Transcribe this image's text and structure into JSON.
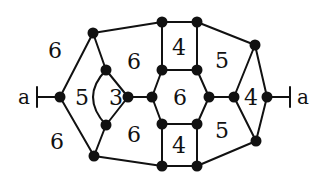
{
  "diagram": {
    "type": "planar-graph",
    "end_labels": {
      "left": "a",
      "right": "a"
    },
    "vertices": [
      {
        "id": "L",
        "x": 60,
        "y": 97
      },
      {
        "id": "TL",
        "x": 93,
        "y": 33
      },
      {
        "id": "BL",
        "x": 94,
        "y": 156
      },
      {
        "id": "T3",
        "x": 106,
        "y": 70
      },
      {
        "id": "B3",
        "x": 106,
        "y": 125
      },
      {
        "id": "R3",
        "x": 128,
        "y": 97
      },
      {
        "id": "H1",
        "x": 152,
        "y": 97
      },
      {
        "id": "H2",
        "x": 162,
        "y": 70
      },
      {
        "id": "H3",
        "x": 197,
        "y": 70
      },
      {
        "id": "H4",
        "x": 209,
        "y": 97
      },
      {
        "id": "H5",
        "x": 197,
        "y": 124
      },
      {
        "id": "H6",
        "x": 162,
        "y": 124
      },
      {
        "id": "S1",
        "x": 162,
        "y": 22
      },
      {
        "id": "S2",
        "x": 197,
        "y": 22
      },
      {
        "id": "S3",
        "x": 162,
        "y": 166
      },
      {
        "id": "S4",
        "x": 197,
        "y": 166
      },
      {
        "id": "RT",
        "x": 255,
        "y": 45
      },
      {
        "id": "RB",
        "x": 256,
        "y": 141
      },
      {
        "id": "RI",
        "x": 234,
        "y": 97
      },
      {
        "id": "R",
        "x": 267,
        "y": 97
      }
    ],
    "edges": [
      [
        "L",
        "TL"
      ],
      [
        "L",
        "BL"
      ],
      [
        "TL",
        "T3"
      ],
      [
        "BL",
        "B3"
      ],
      [
        "T3",
        "R3"
      ],
      [
        "B3",
        "R3"
      ],
      [
        "R3",
        "H1"
      ],
      [
        "H1",
        "H2"
      ],
      [
        "H2",
        "H3"
      ],
      [
        "H3",
        "H4"
      ],
      [
        "H4",
        "H5"
      ],
      [
        "H5",
        "H6"
      ],
      [
        "H6",
        "H1"
      ],
      [
        "TL",
        "S1"
      ],
      [
        "S1",
        "S2"
      ],
      [
        "S1",
        "H2"
      ],
      [
        "S2",
        "H3"
      ],
      [
        "BL",
        "S3"
      ],
      [
        "S3",
        "S4"
      ],
      [
        "S3",
        "H6"
      ],
      [
        "S4",
        "H5"
      ],
      [
        "S2",
        "RT"
      ],
      [
        "S4",
        "RB"
      ],
      [
        "H4",
        "RI"
      ],
      [
        "RI",
        "RT"
      ],
      [
        "RI",
        "RB"
      ],
      [
        "RT",
        "R"
      ],
      [
        "RB",
        "R"
      ]
    ],
    "curved_edges": [
      {
        "from": "T3",
        "to": "B3",
        "control": {
          "x": 80,
          "y": 97
        }
      }
    ],
    "end_ticks": [
      {
        "side": "left",
        "from": "L",
        "tick_x": 37
      },
      {
        "side": "right",
        "from": "R",
        "tick_x": 290
      }
    ],
    "faces": [
      {
        "label": "6",
        "x": 55,
        "y": 50
      },
      {
        "label": "6",
        "x": 57,
        "y": 141
      },
      {
        "label": "5",
        "x": 82,
        "y": 97
      },
      {
        "label": "3",
        "x": 116,
        "y": 97
      },
      {
        "label": "6",
        "x": 134,
        "y": 61
      },
      {
        "label": "6",
        "x": 134,
        "y": 134
      },
      {
        "label": "4",
        "x": 179,
        "y": 47
      },
      {
        "label": "6",
        "x": 180,
        "y": 97
      },
      {
        "label": "4",
        "x": 179,
        "y": 145
      },
      {
        "label": "5",
        "x": 222,
        "y": 60
      },
      {
        "label": "5",
        "x": 222,
        "y": 130
      },
      {
        "label": "4",
        "x": 251,
        "y": 97
      }
    ],
    "end_label_positions": {
      "left": {
        "x": 24,
        "y": 97
      },
      "right": {
        "x": 303,
        "y": 97
      }
    }
  }
}
